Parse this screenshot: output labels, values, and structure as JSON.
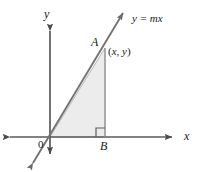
{
  "figure": {
    "type": "geometry-diagram",
    "background_color": "#ffffff",
    "axis_color": "#5a5a5a",
    "line_color": "#6e6e6e",
    "triangle_fill": "#ececec",
    "triangle_stroke": "#9a9a9a",
    "label_color": "#1a1a1a",
    "labels": {
      "y_axis": "y",
      "x_axis": "x",
      "origin": "0",
      "vertex_a": "A",
      "vertex_b": "B",
      "line_equation": "y = mx",
      "point_coordinates_open": "(",
      "point_coordinates_x": "x",
      "point_coordinates_sep": ", ",
      "point_coordinates_y": "y",
      "point_coordinates_close": ")"
    },
    "geometry": {
      "origin": [
        50,
        137
      ],
      "vertex_a": [
        105,
        48
      ],
      "vertex_b": [
        105,
        137
      ],
      "x_axis": [
        6,
        137,
        176,
        137
      ],
      "y_axis": [
        50,
        27,
        50,
        158
      ],
      "line_start": [
        30,
        168
      ],
      "line_end": [
        126,
        8
      ],
      "right_angle_marker": [
        96,
        128,
        9,
        9
      ]
    }
  }
}
